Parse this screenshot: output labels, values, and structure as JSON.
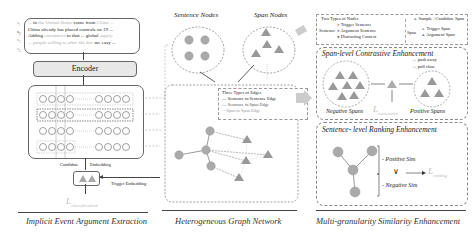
{
  "left_panel": {
    "sentences": [
      {
        "id": "s1",
        "prefix": "... ",
        "text_a": "in",
        "faded_a": "the United States",
        "text_b": "come from",
        "faded_b": "China ..."
      },
      {
        "id": "s2",
        "text": "China already has placed controls on 19 ..."
      },
      {
        "id": "s3",
        "text_a": "Adding",
        "faded_a": "carotenoid",
        "text_b": "to that ... global",
        "faded_b": "supply"
      },
      {
        "id": "s4",
        "faded_a": "... people willing to alter the law",
        "text_b": "are easy ..."
      }
    ],
    "encoder_label": "Encoder",
    "candidate_embedding_label": "Candidate",
    "embedding_label": "Embedding",
    "trigger_embedding_label": "Trigger Embedding",
    "loss_label": "L",
    "loss_subscript": "classification",
    "section_title": "Implicit Event Argument Extraction"
  },
  "middle_panel": {
    "sentence_nodes_label": "Sentence Nodes",
    "span_nodes_label": "Span Nodes",
    "edge_legend": {
      "title": "Three Types of Edges",
      "items": [
        "Sentence to Sentence Edge",
        "Sentence to Span Edge",
        "Span to Span Edge"
      ]
    },
    "section_title": "Heterogeneous Graph Network"
  },
  "right_panel": {
    "node_legend": {
      "title": "Two Types of Nodes",
      "sentence_label": "Sentence",
      "sentence_items": [
        "Trigger Sentence",
        "Argument Sentence",
        "Distracting Context"
      ],
      "span_header": "Sample / Candidate Span",
      "span_label": "Span",
      "span_items": [
        "Trigger Span",
        "Argument Span"
      ]
    },
    "span_contrastive": {
      "title": "Span-level Contrastive Enhancement",
      "push_away": "push away",
      "pull_close": "pull close",
      "negative_label": "Negative Spans",
      "positive_label": "Positive Spans",
      "loss_label": "L",
      "loss_subscript": "contrastive"
    },
    "sentence_ranking": {
      "title": "Sentence- level Ranking Enhancement",
      "positive_sim": "Positive Sim",
      "negative_sim": "Negative Sim",
      "comparator": "∨",
      "loss_label": "L",
      "loss_subscript": "ranking"
    },
    "section_title": "Multi-granularity Similarity Enhancement"
  },
  "colors": {
    "node_gray": "#aaaaaa",
    "border": "#666666",
    "dashed": "#888888",
    "arrow": "#c8c8c8"
  }
}
